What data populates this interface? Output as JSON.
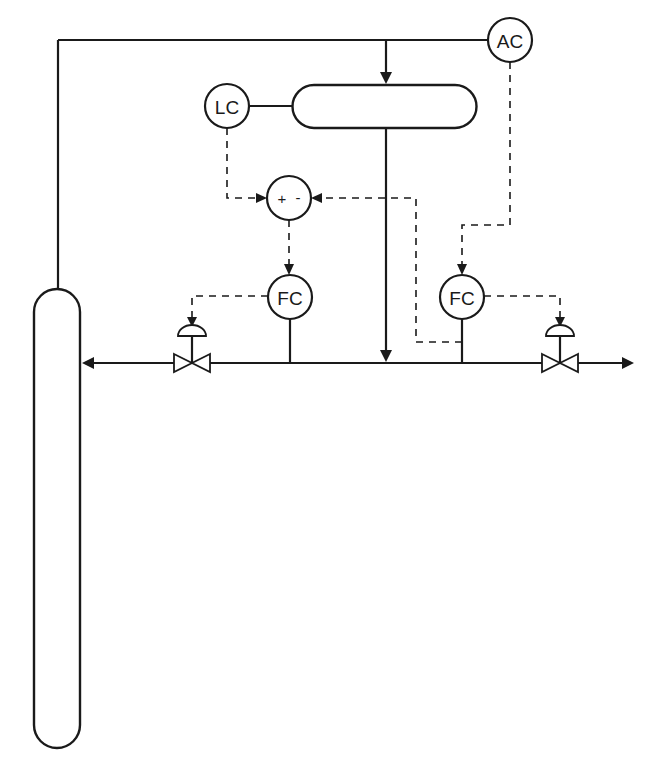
{
  "diagram": {
    "type": "process control P&ID",
    "colors": {
      "line": "#1a1a1a",
      "background": "#ffffff"
    },
    "instruments": [
      {
        "id": "AC",
        "label": "AC",
        "function": "analyzer controller"
      },
      {
        "id": "LC",
        "label": "LC",
        "function": "level controller"
      },
      {
        "id": "SUM",
        "label": "+ -",
        "plus": "+",
        "minus": "-",
        "function": "summing junction"
      },
      {
        "id": "FC1",
        "label": "FC",
        "function": "flow controller (reflux / left)"
      },
      {
        "id": "FC2",
        "label": "FC",
        "function": "flow controller (distillate / right)"
      }
    ],
    "equipment": [
      {
        "id": "column",
        "type": "distillation column"
      },
      {
        "id": "drum",
        "type": "reflux / overhead drum"
      },
      {
        "id": "valve_left",
        "type": "control valve"
      },
      {
        "id": "valve_right",
        "type": "control valve"
      }
    ],
    "connections": [
      {
        "from": "column",
        "to": "drum",
        "type": "process",
        "note": "overhead vapor line"
      },
      {
        "from": "AC",
        "to": "overhead line",
        "type": "process tap"
      },
      {
        "from": "LC",
        "to": "drum",
        "type": "process tap"
      },
      {
        "from": "drum",
        "to": "main line",
        "type": "process"
      },
      {
        "from": "LC",
        "to": "SUM",
        "type": "signal",
        "sign": "+"
      },
      {
        "from": "FC2 measurement",
        "to": "SUM",
        "type": "signal",
        "sign": "-"
      },
      {
        "from": "SUM",
        "to": "FC1",
        "type": "signal",
        "note": "setpoint"
      },
      {
        "from": "AC",
        "to": "FC2",
        "type": "signal",
        "note": "setpoint"
      },
      {
        "from": "FC1",
        "to": "valve_left",
        "type": "signal"
      },
      {
        "from": "FC2",
        "to": "valve_right",
        "type": "signal"
      },
      {
        "from": "main line",
        "to": "column",
        "type": "process",
        "note": "reflux return"
      },
      {
        "from": "main line",
        "to": "outlet",
        "type": "process",
        "note": "product out"
      }
    ]
  }
}
